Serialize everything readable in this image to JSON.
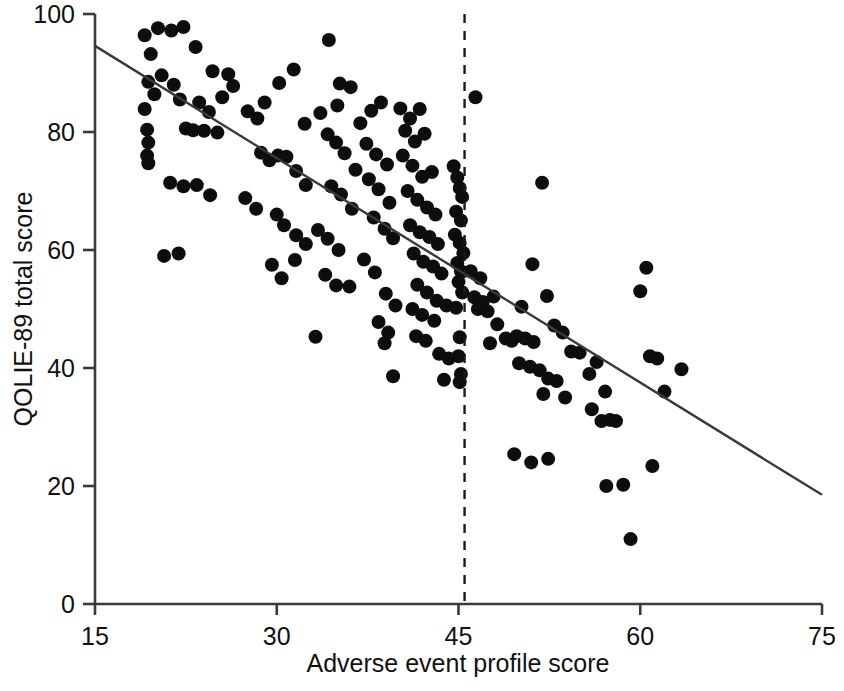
{
  "figure": {
    "kind": "scatter-plot",
    "background_color": "#ffffff",
    "ink_color": "#111111"
  },
  "axes": {
    "x_title": "Adverse event profile score",
    "y_title": "QOLIE-89 total score",
    "x_ticks": [
      "15",
      "30",
      "45",
      "60",
      "75"
    ],
    "y_ticks": [
      "0",
      "20",
      "40",
      "60",
      "80",
      "100"
    ]
  },
  "chart_data": {
    "type": "scatter",
    "title": "",
    "xlabel": "Adverse event profile score",
    "ylabel": "QOLIE-89 total score",
    "xlim": [
      15,
      75
    ],
    "ylim": [
      0,
      100
    ],
    "xticks": [
      15,
      30,
      45,
      60,
      75
    ],
    "yticks": [
      0,
      20,
      40,
      60,
      80,
      100
    ],
    "grid": false,
    "legend": "none",
    "marker": {
      "shape": "circle",
      "color": "#0d0d0d",
      "size_px": 14
    },
    "annotations": [
      {
        "kind": "vertical-dashed-line",
        "label": "cut-off",
        "x": 45.5,
        "style": "dashed",
        "color": "#1a1a1a"
      },
      {
        "kind": "regression-line",
        "label": "linear fit",
        "x_start": 15,
        "y_start": 94.6,
        "x_end": 75,
        "y_end": 18.5,
        "slope": -1.268,
        "intercept": 113.6,
        "color": "#3a3a3a"
      }
    ],
    "n_points": 190,
    "points": [
      [
        19.1,
        96.4
      ],
      [
        19.6,
        93.2
      ],
      [
        20.2,
        97.6
      ],
      [
        21.3,
        97.2
      ],
      [
        22.3,
        97.8
      ],
      [
        19.4,
        88.5
      ],
      [
        19.9,
        86.4
      ],
      [
        20.5,
        89.6
      ],
      [
        21.5,
        88.0
      ],
      [
        22.0,
        85.5
      ],
      [
        19.1,
        83.9
      ],
      [
        19.3,
        80.4
      ],
      [
        19.4,
        78.2
      ],
      [
        19.3,
        76.0
      ],
      [
        19.4,
        74.7
      ],
      [
        23.3,
        94.4
      ],
      [
        24.7,
        90.3
      ],
      [
        26.0,
        89.8
      ],
      [
        23.6,
        85.0
      ],
      [
        24.4,
        83.4
      ],
      [
        25.5,
        85.9
      ],
      [
        26.4,
        87.8
      ],
      [
        27.6,
        83.5
      ],
      [
        28.4,
        82.3
      ],
      [
        29.0,
        85.0
      ],
      [
        22.5,
        80.6
      ],
      [
        23.1,
        80.3
      ],
      [
        24.0,
        80.2
      ],
      [
        25.1,
        79.9
      ],
      [
        21.2,
        71.4
      ],
      [
        22.3,
        70.8
      ],
      [
        23.4,
        71.0
      ],
      [
        24.5,
        69.3
      ],
      [
        20.7,
        59.0
      ],
      [
        21.9,
        59.4
      ],
      [
        30.2,
        88.3
      ],
      [
        31.4,
        90.6
      ],
      [
        32.3,
        81.4
      ],
      [
        33.6,
        83.2
      ],
      [
        30.1,
        76.0
      ],
      [
        30.8,
        75.8
      ],
      [
        31.6,
        73.4
      ],
      [
        32.4,
        71.0
      ],
      [
        28.7,
        76.5
      ],
      [
        29.4,
        75.2
      ],
      [
        27.4,
        68.8
      ],
      [
        28.3,
        67.0
      ],
      [
        30.0,
        66.0
      ],
      [
        30.6,
        64.2
      ],
      [
        31.6,
        62.5
      ],
      [
        32.4,
        61.0
      ],
      [
        29.6,
        57.5
      ],
      [
        30.4,
        55.2
      ],
      [
        31.5,
        58.3
      ],
      [
        33.2,
        45.3
      ],
      [
        34.3,
        95.6
      ],
      [
        35.2,
        88.2
      ],
      [
        36.1,
        87.6
      ],
      [
        35.0,
        84.5
      ],
      [
        34.2,
        79.6
      ],
      [
        34.9,
        78.2
      ],
      [
        35.6,
        76.4
      ],
      [
        36.5,
        73.6
      ],
      [
        34.5,
        70.8
      ],
      [
        35.3,
        69.4
      ],
      [
        36.2,
        67.0
      ],
      [
        33.4,
        63.4
      ],
      [
        34.2,
        61.9
      ],
      [
        35.1,
        60.0
      ],
      [
        34.0,
        55.8
      ],
      [
        34.9,
        54.0
      ],
      [
        36.0,
        53.8
      ],
      [
        36.9,
        81.5
      ],
      [
        37.8,
        83.6
      ],
      [
        38.6,
        85.0
      ],
      [
        37.4,
        78.0
      ],
      [
        38.2,
        76.2
      ],
      [
        39.1,
        74.5
      ],
      [
        37.6,
        72.0
      ],
      [
        38.4,
        70.3
      ],
      [
        39.3,
        68.0
      ],
      [
        38.0,
        65.5
      ],
      [
        38.9,
        63.6
      ],
      [
        39.6,
        62.0
      ],
      [
        37.2,
        58.4
      ],
      [
        38.1,
        56.2
      ],
      [
        39.0,
        52.6
      ],
      [
        39.8,
        50.6
      ],
      [
        38.4,
        47.8
      ],
      [
        39.2,
        46.0
      ],
      [
        38.9,
        44.2
      ],
      [
        39.6,
        38.6
      ],
      [
        40.2,
        84.0
      ],
      [
        41.0,
        82.3
      ],
      [
        41.8,
        83.9
      ],
      [
        40.6,
        80.2
      ],
      [
        41.4,
        78.4
      ],
      [
        42.2,
        79.7
      ],
      [
        40.4,
        76.0
      ],
      [
        41.2,
        74.3
      ],
      [
        42.0,
        72.4
      ],
      [
        42.8,
        73.2
      ],
      [
        40.8,
        70.0
      ],
      [
        41.6,
        68.5
      ],
      [
        42.4,
        67.2
      ],
      [
        43.1,
        66.0
      ],
      [
        41.0,
        64.2
      ],
      [
        41.8,
        63.0
      ],
      [
        42.6,
        62.2
      ],
      [
        43.3,
        61.0
      ],
      [
        41.3,
        59.4
      ],
      [
        42.1,
        58.0
      ],
      [
        42.9,
        57.2
      ],
      [
        43.6,
        56.0
      ],
      [
        41.6,
        54.1
      ],
      [
        42.4,
        52.8
      ],
      [
        43.2,
        51.4
      ],
      [
        44.0,
        50.6
      ],
      [
        41.2,
        50.0
      ],
      [
        42.0,
        49.0
      ],
      [
        43.0,
        48.0
      ],
      [
        41.5,
        45.4
      ],
      [
        42.3,
        44.6
      ],
      [
        43.4,
        42.4
      ],
      [
        44.2,
        41.6
      ],
      [
        43.8,
        38.0
      ],
      [
        44.6,
        74.2
      ],
      [
        44.9,
        72.3
      ],
      [
        45.1,
        70.5
      ],
      [
        45.3,
        69.0
      ],
      [
        44.8,
        66.5
      ],
      [
        45.2,
        65.0
      ],
      [
        44.7,
        62.6
      ],
      [
        45.1,
        61.2
      ],
      [
        45.4,
        59.5
      ],
      [
        44.9,
        57.8
      ],
      [
        45.2,
        56.4
      ],
      [
        45.0,
        54.6
      ],
      [
        45.3,
        52.8
      ],
      [
        44.8,
        50.2
      ],
      [
        45.1,
        45.2
      ],
      [
        45.0,
        42.0
      ],
      [
        45.2,
        39.0
      ],
      [
        45.1,
        37.6
      ],
      [
        46.4,
        85.9
      ],
      [
        46.0,
        56.4
      ],
      [
        46.8,
        55.2
      ],
      [
        46.3,
        52.0
      ],
      [
        47.0,
        51.2
      ],
      [
        46.6,
        50.0
      ],
      [
        47.4,
        49.6
      ],
      [
        47.9,
        52.1
      ],
      [
        48.2,
        47.4
      ],
      [
        48.9,
        45.0
      ],
      [
        49.4,
        44.6
      ],
      [
        47.6,
        44.2
      ],
      [
        49.8,
        45.4
      ],
      [
        50.5,
        45.0
      ],
      [
        51.2,
        44.4
      ],
      [
        51.9,
        71.4
      ],
      [
        51.1,
        57.6
      ],
      [
        52.3,
        52.2
      ],
      [
        50.2,
        50.4
      ],
      [
        52.9,
        47.2
      ],
      [
        53.6,
        46.0
      ],
      [
        54.3,
        42.8
      ],
      [
        50.0,
        40.8
      ],
      [
        50.9,
        40.2
      ],
      [
        51.7,
        39.6
      ],
      [
        52.4,
        38.2
      ],
      [
        53.1,
        37.8
      ],
      [
        52.0,
        35.6
      ],
      [
        53.8,
        35.0
      ],
      [
        49.6,
        25.4
      ],
      [
        52.4,
        24.6
      ],
      [
        51.0,
        24.0
      ],
      [
        55.0,
        42.6
      ],
      [
        55.8,
        39.0
      ],
      [
        56.4,
        41.0
      ],
      [
        57.1,
        36.0
      ],
      [
        56.0,
        33.0
      ],
      [
        56.8,
        31.0
      ],
      [
        57.5,
        31.2
      ],
      [
        58.0,
        31.0
      ],
      [
        57.2,
        20.0
      ],
      [
        58.6,
        20.2
      ],
      [
        59.2,
        11.0
      ],
      [
        60.5,
        57.0
      ],
      [
        60.0,
        53.0
      ],
      [
        60.8,
        42.0
      ],
      [
        61.4,
        41.6
      ],
      [
        62.0,
        36.0
      ],
      [
        61.0,
        23.4
      ],
      [
        63.4,
        39.8
      ]
    ]
  }
}
